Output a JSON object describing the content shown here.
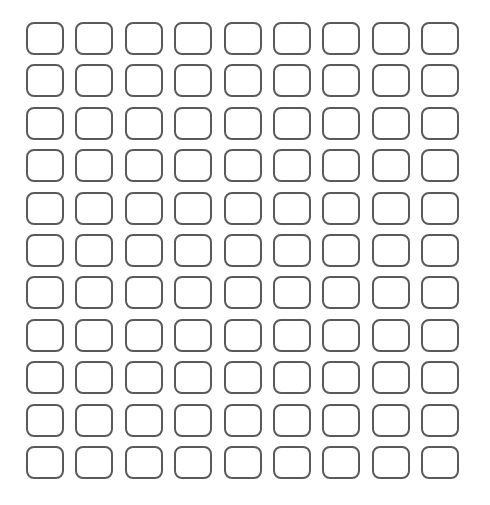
{
  "grid": {
    "rows": 11,
    "columns": 9,
    "cell_state": "empty",
    "border_color": "#5a5a5a",
    "background_color": "#ffffff"
  }
}
